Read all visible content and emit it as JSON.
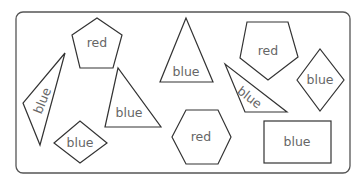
{
  "diagram": {
    "title": "",
    "shapes": [
      {
        "id": "pentagon-top-left",
        "type": "pentagon",
        "label": "red"
      },
      {
        "id": "skinny-triangle-left",
        "type": "triangle",
        "label": "blue"
      },
      {
        "id": "triangle-middle-left",
        "type": "triangle",
        "label": "blue"
      },
      {
        "id": "diamond-bottom-left",
        "type": "rhombus",
        "label": "blue"
      },
      {
        "id": "triangle-center",
        "type": "triangle",
        "label": "blue"
      },
      {
        "id": "hexagon-bottom-center",
        "type": "hexagon",
        "label": "red"
      },
      {
        "id": "pentagon-top-right",
        "type": "pentagon",
        "label": "red"
      },
      {
        "id": "skinny-triangle-right",
        "type": "triangle",
        "label": "blue"
      },
      {
        "id": "diamond-right",
        "type": "rhombus",
        "label": "blue"
      },
      {
        "id": "rectangle-bottom-right",
        "type": "rectangle",
        "label": "blue"
      }
    ]
  }
}
